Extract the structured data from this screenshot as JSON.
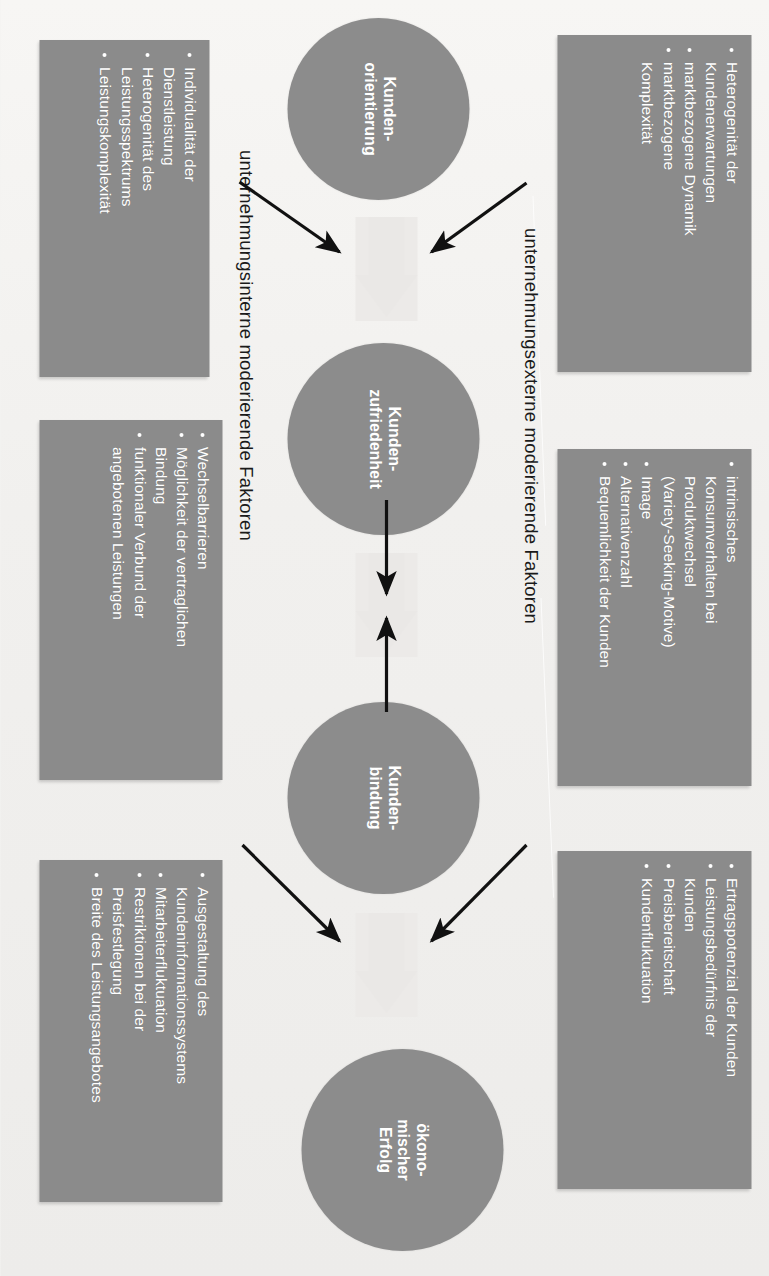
{
  "diagram": {
    "colors": {
      "box_fill": "#8b8b8b",
      "circle_fill": "#8c8c8c",
      "box_text": "#ffffff",
      "caption_text": "#1a1a1a",
      "block_arrow": "#eae8e6",
      "thin_arrow": "#111111",
      "page_background": "#f4f3f1"
    },
    "captions": {
      "external": "unternehmungsexterne moderierende Faktoren",
      "internal": "unternehmungsinterne moderierende Faktoren"
    },
    "circles": [
      {
        "id": "kundenorientierung",
        "line1": "Kunden-",
        "line2": "orientierung"
      },
      {
        "id": "kundenzufriedenheit",
        "line1": "Kunden-",
        "line2": "zufriedenheit"
      },
      {
        "id": "kundenbindung",
        "line1": "Kunden-",
        "line2": "bindung"
      },
      {
        "id": "oekonomischer-erfolg",
        "line1": "ökono-",
        "line2": "mischer",
        "line3": "Erfolg"
      }
    ],
    "external_boxes": [
      {
        "id": "ext-orientierung",
        "items": [
          {
            "text": "Heterogenität der",
            "bullet": true
          },
          {
            "text": "Kundenerwartungen",
            "bullet": false
          },
          {
            "text": "marktbezogene Dynamik",
            "bullet": true
          },
          {
            "text": "marktbezogene",
            "bullet": true
          },
          {
            "text": "Komplexität",
            "bullet": false
          }
        ]
      },
      {
        "id": "ext-zufriedenheit",
        "items": [
          {
            "text": "intrinsisches",
            "bullet": true
          },
          {
            "text": "Konsumverhalten bei",
            "bullet": false
          },
          {
            "text": "Produktwechsel",
            "bullet": false
          },
          {
            "text": "(Variety-Seeking-Motive)",
            "bullet": false
          },
          {
            "text": "Image",
            "bullet": true
          },
          {
            "text": "Alternativenzahl",
            "bullet": true
          },
          {
            "text": "Bequemlichkeit der Kunden",
            "bullet": true
          }
        ]
      },
      {
        "id": "ext-bindung",
        "items": [
          {
            "text": "Ertragspotenzial der Kunden",
            "bullet": true
          },
          {
            "text": "Leistungsbedürfnis der",
            "bullet": true
          },
          {
            "text": "Kunden",
            "bullet": false
          },
          {
            "text": "Preisbereitschaft",
            "bullet": true
          },
          {
            "text": "Kundenfluktuation",
            "bullet": true
          }
        ]
      }
    ],
    "internal_boxes": [
      {
        "id": "int-orientierung",
        "items": [
          {
            "text": "Individualität der",
            "bullet": true
          },
          {
            "text": "Dienstleistung",
            "bullet": false
          },
          {
            "text": "Heterogenität des",
            "bullet": true
          },
          {
            "text": "Leistungsspektrums",
            "bullet": false
          },
          {
            "text": "Leistungskomplexität",
            "bullet": true
          }
        ]
      },
      {
        "id": "int-zufriedenheit",
        "items": [
          {
            "text": "Wechselbarrieren",
            "bullet": true
          },
          {
            "text": "Möglichkeit der vertraglichen",
            "bullet": true
          },
          {
            "text": "Bindung",
            "bullet": false
          },
          {
            "text": "funktionaler Verbund der",
            "bullet": true
          },
          {
            "text": "angebotenen Leistungen",
            "bullet": false
          }
        ]
      },
      {
        "id": "int-bindung",
        "items": [
          {
            "text": "Ausgestaltung des",
            "bullet": true
          },
          {
            "text": "Kundeninformationssystems",
            "bullet": false
          },
          {
            "text": "Mitarbeiterfluktuation",
            "bullet": true
          },
          {
            "text": "Restriktionen bei der",
            "bullet": true
          },
          {
            "text": "Preisfestlegung",
            "bullet": false
          },
          {
            "text": "Breite des Leistungsangebotes",
            "bullet": true
          }
        ]
      }
    ],
    "flow_arrows": [
      {
        "id": "orientierung-to-zufriedenheit",
        "kind": "block",
        "direction": "right"
      },
      {
        "id": "zufriedenheit-to-bindung",
        "kind": "block",
        "direction": "right"
      },
      {
        "id": "bindung-to-erfolg",
        "kind": "block",
        "direction": "right"
      }
    ],
    "moderator_arrows": [
      {
        "id": "ext-to-flow-1",
        "from": "external box",
        "to": "block arrow 1"
      },
      {
        "id": "int-to-flow-1",
        "from": "internal box",
        "to": "block arrow 1"
      },
      {
        "id": "ext-to-flow-2",
        "from": "external box",
        "to": "block arrow 2"
      },
      {
        "id": "int-to-flow-2",
        "from": "internal box",
        "to": "block arrow 2"
      },
      {
        "id": "ext-to-flow-3",
        "from": "external box",
        "to": "block arrow 3"
      },
      {
        "id": "int-to-flow-3",
        "from": "internal box",
        "to": "block arrow 3"
      }
    ]
  }
}
